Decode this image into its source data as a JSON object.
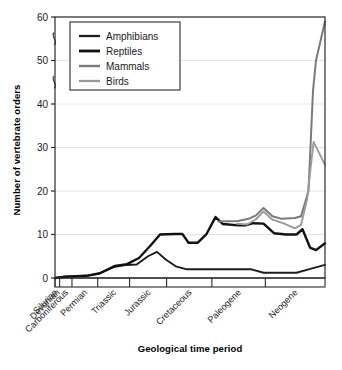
{
  "chart_data": {
    "type": "line",
    "title": "",
    "xlabel": "Geological time period",
    "ylabel": "Number of vertebrate orders",
    "categories": [
      "Silurian",
      "Devonian",
      "Carboniferous",
      "Permian",
      "Triassic",
      "Jurassic",
      "Cretaceous",
      "Paleogene",
      "Neogene"
    ],
    "ylim": [
      0,
      60
    ],
    "yticks": [
      0,
      10,
      20,
      30,
      40,
      50,
      60
    ],
    "ytick_labels": [
      "0",
      "10",
      "20",
      "30",
      "40",
      "50",
      "60"
    ],
    "grid": true,
    "axis_breaks": [
      "between 40 and 50",
      "between 50 and 60"
    ],
    "legend_position": "top-left inside",
    "x_boundaries": [
      0.0,
      0.09,
      0.24,
      0.5,
      0.62,
      0.72,
      0.88,
      1.04,
      1.16
    ],
    "series": [
      {
        "name": "Amphibians",
        "color": "#1c1c1c",
        "width": 1.9,
        "points": [
          {
            "x": 0.0,
            "y": 0.0
          },
          {
            "x": 0.3,
            "y": 0.3
          },
          {
            "x": 1.05,
            "y": 0.5
          },
          {
            "x": 1.45,
            "y": 1.0
          },
          {
            "x": 2.0,
            "y": 2.6
          },
          {
            "x": 2.35,
            "y": 3.0
          },
          {
            "x": 2.72,
            "y": 3.1
          },
          {
            "x": 3.1,
            "y": 5.0
          },
          {
            "x": 3.4,
            "y": 6.0
          },
          {
            "x": 3.7,
            "y": 4.2
          },
          {
            "x": 4.05,
            "y": 2.6
          },
          {
            "x": 4.4,
            "y": 2.0
          },
          {
            "x": 5.0,
            "y": 2.0
          },
          {
            "x": 6.0,
            "y": 2.0
          },
          {
            "x": 6.55,
            "y": 2.0
          },
          {
            "x": 6.95,
            "y": 1.2
          },
          {
            "x": 7.8,
            "y": 1.2
          },
          {
            "x": 8.05,
            "y": 1.2
          },
          {
            "x": 8.45,
            "y": 2.0
          },
          {
            "x": 9.0,
            "y": 3.0
          }
        ]
      },
      {
        "name": "Reptiles",
        "color": "#111111",
        "width": 2.4,
        "points": [
          {
            "x": 0.0,
            "y": 0.0
          },
          {
            "x": 0.35,
            "y": 0.3
          },
          {
            "x": 1.05,
            "y": 0.5
          },
          {
            "x": 1.5,
            "y": 1.1
          },
          {
            "x": 2.0,
            "y": 2.8
          },
          {
            "x": 2.4,
            "y": 3.2
          },
          {
            "x": 2.8,
            "y": 4.6
          },
          {
            "x": 3.2,
            "y": 7.6
          },
          {
            "x": 3.5,
            "y": 10.0
          },
          {
            "x": 4.0,
            "y": 10.1
          },
          {
            "x": 4.25,
            "y": 10.1
          },
          {
            "x": 4.45,
            "y": 8.1
          },
          {
            "x": 4.75,
            "y": 8.1
          },
          {
            "x": 5.05,
            "y": 10.1
          },
          {
            "x": 5.35,
            "y": 14.0
          },
          {
            "x": 5.6,
            "y": 12.4
          },
          {
            "x": 6.1,
            "y": 12.1
          },
          {
            "x": 6.35,
            "y": 12.1
          },
          {
            "x": 6.6,
            "y": 12.6
          },
          {
            "x": 6.95,
            "y": 12.5
          },
          {
            "x": 7.3,
            "y": 10.3
          },
          {
            "x": 7.7,
            "y": 10.0
          },
          {
            "x": 8.05,
            "y": 10.0
          },
          {
            "x": 8.25,
            "y": 11.2
          },
          {
            "x": 8.5,
            "y": 7.0
          },
          {
            "x": 8.7,
            "y": 6.4
          },
          {
            "x": 9.0,
            "y": 8.0
          }
        ]
      },
      {
        "name": "Mammals",
        "color": "#7a7a7a",
        "width": 2.0,
        "points": [
          {
            "x": 5.45,
            "y": 13.0
          },
          {
            "x": 6.1,
            "y": 13.1
          },
          {
            "x": 6.45,
            "y": 13.6
          },
          {
            "x": 6.7,
            "y": 14.4
          },
          {
            "x": 6.95,
            "y": 16.1
          },
          {
            "x": 7.25,
            "y": 14.2
          },
          {
            "x": 7.55,
            "y": 13.6
          },
          {
            "x": 8.0,
            "y": 13.8
          },
          {
            "x": 8.2,
            "y": 14.2
          },
          {
            "x": 8.45,
            "y": 20.0
          },
          {
            "x": 8.6,
            "y": 43.0
          },
          {
            "x": 8.7,
            "y": 50.0
          },
          {
            "x": 9.0,
            "y": 59.0
          }
        ]
      },
      {
        "name": "Birds",
        "color": "#9a9a9a",
        "width": 1.9,
        "points": [
          {
            "x": 6.05,
            "y": 12.5
          },
          {
            "x": 6.4,
            "y": 12.3
          },
          {
            "x": 6.7,
            "y": 13.5
          },
          {
            "x": 6.95,
            "y": 15.3
          },
          {
            "x": 7.25,
            "y": 13.4
          },
          {
            "x": 7.6,
            "y": 12.6
          },
          {
            "x": 8.0,
            "y": 11.4
          },
          {
            "x": 8.2,
            "y": 12.2
          },
          {
            "x": 8.4,
            "y": 18.0
          },
          {
            "x": 8.62,
            "y": 31.3
          },
          {
            "x": 9.0,
            "y": 26.0
          }
        ]
      }
    ]
  }
}
